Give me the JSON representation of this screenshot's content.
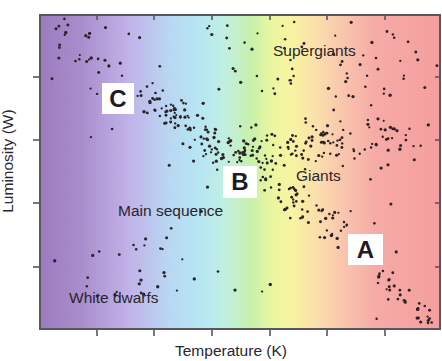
{
  "chart_data": {
    "type": "scatter",
    "xlabel": "Temperature (K)",
    "ylabel": "Luminosity (W)",
    "x_tick_labels": [],
    "y_tick_labels": [],
    "x_ticks_px": [
      97,
      154,
      212,
      270,
      327,
      385
    ],
    "y_ticks_px": [
      77,
      140,
      203,
      267
    ],
    "grid": false,
    "legend": null,
    "background": "temperature color gradient: purple (left) → blue → green → yellow → red (right)",
    "regions": [
      {
        "name": "Supergiants",
        "description": "sparse stars across the top band"
      },
      {
        "name": "Giants",
        "description": "horizontal band of stars at mid-upper right"
      },
      {
        "name": "Main sequence",
        "description": "diagonal band from upper left to lower right"
      },
      {
        "name": "White dwarfs",
        "description": "sparse stars at lower left"
      }
    ],
    "annotations": [
      {
        "label": "C",
        "location": "upper-left of main sequence"
      },
      {
        "label": "B",
        "location": "middle of main sequence"
      },
      {
        "label": "A",
        "location": "lower-right of main sequence"
      }
    ]
  },
  "axes": {
    "x_label": "Temperature (K)",
    "y_label": "Luminosity (W)"
  },
  "regions": {
    "supergiants": "Supergiants",
    "giants": "Giants",
    "main_sequence": "Main sequence",
    "white_dwarfs": "White dwarfs"
  },
  "points": {
    "a": "A",
    "b": "B",
    "c": "C"
  },
  "colors": {
    "dot": "#2b2328",
    "frame": "#5a5560",
    "label_box": "#ffffff"
  },
  "clusters": [
    {
      "name": "main-sequence-upper",
      "n": 70,
      "x0": 55,
      "y0": 30,
      "x1": 230,
      "y1": 160,
      "spread": 11,
      "seed": 3
    },
    {
      "name": "main-sequence-mid",
      "n": 150,
      "x0": 150,
      "y0": 100,
      "x1": 350,
      "y1": 235,
      "spread": 10,
      "seed": 7
    },
    {
      "name": "main-sequence-lower",
      "n": 45,
      "x0": 355,
      "y0": 248,
      "x1": 432,
      "y1": 325,
      "spread": 7,
      "seed": 11
    },
    {
      "name": "giants",
      "n": 130,
      "x0": 232,
      "y0": 150,
      "x1": 410,
      "y1": 134,
      "spread": 11,
      "seed": 19
    },
    {
      "name": "supergiants",
      "n": 60,
      "x0": 205,
      "y0": 20,
      "x1": 440,
      "y1": 100,
      "spread": 0,
      "box": true,
      "seed": 23
    },
    {
      "name": "white-dwarfs",
      "n": 24,
      "x0": 85,
      "y0": 245,
      "x1": 200,
      "y1": 300,
      "spread": 0,
      "box": true,
      "seed": 29
    },
    {
      "name": "scattered",
      "n": 30,
      "x0": 45,
      "y0": 20,
      "x1": 440,
      "y1": 325,
      "spread": 0,
      "box": true,
      "seed": 31
    }
  ]
}
